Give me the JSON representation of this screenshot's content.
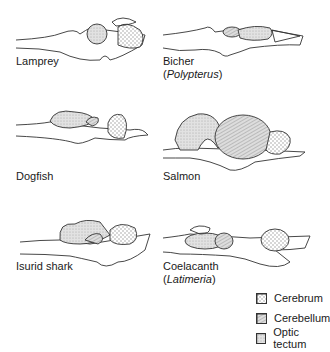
{
  "figure": {
    "panels": [
      {
        "name": "Lamprey",
        "label": "Lamprey",
        "sublabel": ""
      },
      {
        "name": "Bicher",
        "label": "Bicher",
        "sublabel": "Polypterus"
      },
      {
        "name": "Dogfish",
        "label": "Dogfish",
        "sublabel": ""
      },
      {
        "name": "Salmon",
        "label": "Salmon",
        "sublabel": ""
      },
      {
        "name": "Isurid shark",
        "label": "Isurid shark",
        "sublabel": ""
      },
      {
        "name": "Coelacanth",
        "label": "Coelacanth",
        "sublabel": "Latimeria"
      }
    ],
    "legend": [
      {
        "label": "Cerebrum",
        "pattern": "vertical-dashes"
      },
      {
        "label": "Cerebellum",
        "pattern": "diagonal-hatch"
      },
      {
        "label": "Optic tectum",
        "pattern": "stipple"
      }
    ],
    "colors": {
      "line": "#333333",
      "fill_light": "#e6e6e6",
      "fill_mid": "#d2d2d2"
    }
  }
}
